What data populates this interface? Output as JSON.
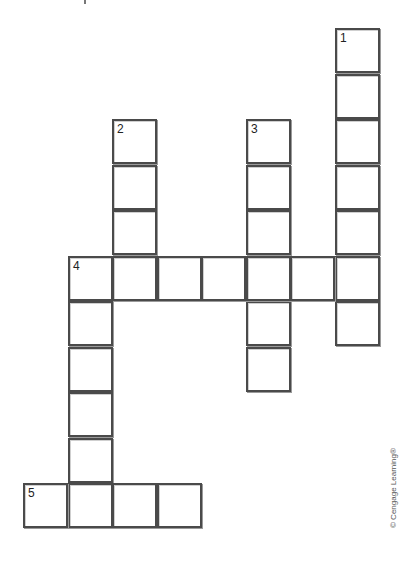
{
  "puzzle": {
    "type": "crossword",
    "grid": {
      "cell_size": 45,
      "origin_x": 23,
      "origin_y": 28,
      "pitch_x": 44.5,
      "pitch_y": 45.5
    },
    "clue_numbers": [
      {
        "number": "1",
        "row": 0,
        "col": 7
      },
      {
        "number": "2",
        "row": 2,
        "col": 2
      },
      {
        "number": "3",
        "row": 2,
        "col": 5
      },
      {
        "number": "4",
        "row": 5,
        "col": 1
      },
      {
        "number": "5",
        "row": 10,
        "col": 0
      }
    ],
    "words": [
      {
        "number": "1",
        "direction": "down",
        "row": 0,
        "col": 7,
        "length": 7
      },
      {
        "number": "2",
        "direction": "down",
        "row": 2,
        "col": 2,
        "length": 4
      },
      {
        "number": "3",
        "direction": "down",
        "row": 2,
        "col": 5,
        "length": 6
      },
      {
        "number": "4",
        "direction": "across",
        "row": 5,
        "col": 1,
        "length": 7
      },
      {
        "number": "4",
        "direction": "down",
        "row": 5,
        "col": 1,
        "length": 6
      },
      {
        "number": "5",
        "direction": "across",
        "row": 10,
        "col": 0,
        "length": 4
      }
    ],
    "cells": [
      [
        0,
        7
      ],
      [
        1,
        7
      ],
      [
        2,
        7
      ],
      [
        3,
        7
      ],
      [
        4,
        7
      ],
      [
        5,
        7
      ],
      [
        6,
        7
      ],
      [
        2,
        2
      ],
      [
        3,
        2
      ],
      [
        4,
        2
      ],
      [
        2,
        5
      ],
      [
        3,
        5
      ],
      [
        4,
        5
      ],
      [
        6,
        5
      ],
      [
        7,
        5
      ],
      [
        5,
        1
      ],
      [
        5,
        2
      ],
      [
        5,
        3
      ],
      [
        5,
        4
      ],
      [
        5,
        5
      ],
      [
        5,
        6
      ],
      [
        6,
        1
      ],
      [
        7,
        1
      ],
      [
        8,
        1
      ],
      [
        9,
        1
      ],
      [
        10,
        1
      ],
      [
        10,
        0
      ],
      [
        10,
        2
      ],
      [
        10,
        3
      ]
    ]
  },
  "credit": "© Cengage Learning®"
}
